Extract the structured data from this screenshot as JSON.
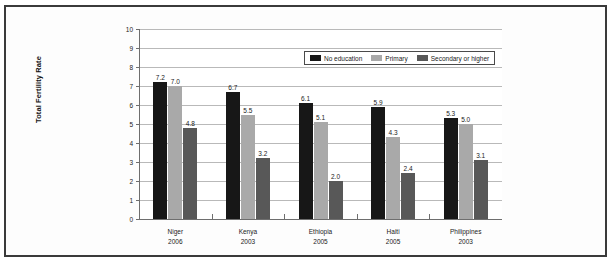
{
  "chart_data": {
    "type": "bar",
    "title": "",
    "xlabel": "",
    "ylabel": "Total Fertility Rate",
    "ylim": [
      0,
      10
    ],
    "ytick_labels": [
      "10",
      "9",
      "8",
      "7",
      "6",
      "5",
      "4",
      "3",
      "2",
      "1",
      "0"
    ],
    "yticks": [
      10,
      9,
      8,
      7,
      6,
      5,
      4,
      3,
      2,
      1,
      0
    ],
    "grid": true,
    "legend_position": "top-right-inside",
    "categories": [
      "Niger",
      "Kenya",
      "Ethiopia",
      "Haiti",
      "Philippines"
    ],
    "category_years": [
      "2006",
      "2003",
      "2005",
      "2005",
      "2003"
    ],
    "series": [
      {
        "name": "No education",
        "color": "#171717",
        "values": [
          7.2,
          6.7,
          6.1,
          5.9,
          5.3
        ],
        "labels": [
          "7.2",
          "6.7",
          "6.1",
          "5.9",
          "5.3"
        ]
      },
      {
        "name": "Primary",
        "color": "#a9a9a9",
        "values": [
          7.0,
          5.5,
          5.1,
          4.3,
          5.0
        ],
        "labels": [
          "7.0",
          "5.5",
          "5.1",
          "4.3",
          "5.0"
        ]
      },
      {
        "name": "Secondary or higher",
        "color": "#585858",
        "values": [
          4.8,
          3.2,
          2.0,
          2.4,
          3.1
        ],
        "labels": [
          "4.8",
          "3.2",
          "2.0",
          "2.4",
          "3.1"
        ]
      }
    ]
  },
  "legend": {
    "items": [
      {
        "label": "No education"
      },
      {
        "label": "Primary"
      },
      {
        "label": "Secondary or higher"
      }
    ]
  }
}
